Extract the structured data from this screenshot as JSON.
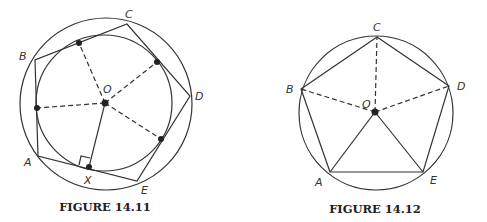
{
  "figures": [
    {
      "caption": "FIGURE 14.11",
      "labels": {
        "A": "A",
        "B": "B",
        "C": "C",
        "D": "D",
        "E": "E",
        "O": "O",
        "X": "X"
      },
      "description": "Pentagon ABCDE circumscribed about an inner circle and inscribed in an outer circle, center O; dashed radii to tangent points, solid radius OX perpendicular to side AE with right-angle marker"
    },
    {
      "caption": "FIGURE 14.12",
      "labels": {
        "A": "A",
        "B": "B",
        "C": "C",
        "D": "D",
        "E": "E",
        "O": "O"
      },
      "description": "Regular pentagon ABCDE inscribed in a circle with center O; dashed segments OB, OC, OD; solid segments OA, OE"
    }
  ],
  "colors": {
    "stroke": "#333333",
    "point": "#222222",
    "background": "#ffffff"
  }
}
